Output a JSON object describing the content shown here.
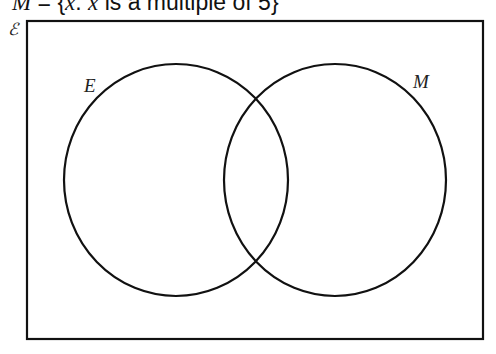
{
  "title": {
    "set_var": "M",
    "equals": " = {",
    "elem_var": "x",
    "colon": ": ",
    "elem_var2": "x",
    "rest": " is a multiple of 5}"
  },
  "diagram": {
    "universal_symbol": "ℰ",
    "sets": [
      {
        "label": "E",
        "cx": 176,
        "cy": 180,
        "rx": 112,
        "ry": 116
      },
      {
        "label": "M",
        "cx": 335,
        "cy": 180,
        "rx": 111,
        "ry": 116
      }
    ],
    "box": {
      "x": 27,
      "y": 21,
      "width": 456,
      "height": 318
    },
    "stroke_color": "#111111",
    "background": "#ffffff"
  }
}
